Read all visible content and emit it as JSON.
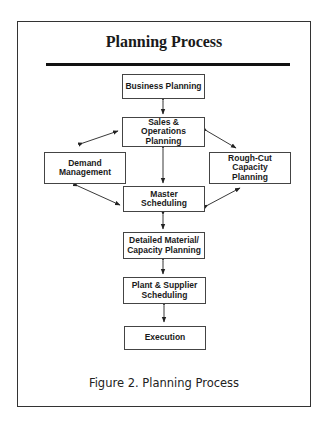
{
  "figure": {
    "title": "Planning Process",
    "caption": "Figure 2. Planning Process"
  },
  "nodes": {
    "business_planning": "Business Planning",
    "sales_operations_planning": "Sales & Operations Planning",
    "demand_management": "Demand Management",
    "rough_cut_capacity_planning": "Rough-Cut Capacity Planning",
    "master_scheduling": "Master Scheduling",
    "detailed_material_capacity_planning": "Detailed Material/ Capacity Planning",
    "plant_supplier_scheduling": "Plant & Supplier Scheduling",
    "execution": "Execution"
  },
  "edges": [
    {
      "from": "Business Planning",
      "to": "Sales & Operations Planning",
      "type": "bidirectional"
    },
    {
      "from": "Sales & Operations Planning",
      "to": "Demand Management",
      "type": "bidirectional"
    },
    {
      "from": "Sales & Operations Planning",
      "to": "Rough-Cut Capacity Planning",
      "type": "bidirectional"
    },
    {
      "from": "Sales & Operations Planning",
      "to": "Master Scheduling",
      "type": "bidirectional"
    },
    {
      "from": "Demand Management",
      "to": "Master Scheduling",
      "type": "bidirectional"
    },
    {
      "from": "Rough-Cut Capacity Planning",
      "to": "Master Scheduling",
      "type": "bidirectional"
    },
    {
      "from": "Master Scheduling",
      "to": "Detailed Material/ Capacity Planning",
      "type": "bidirectional"
    },
    {
      "from": "Detailed Material/ Capacity Planning",
      "to": "Plant & Supplier Scheduling",
      "type": "bidirectional"
    },
    {
      "from": "Plant & Supplier Scheduling",
      "to": "Execution",
      "type": "bidirectional"
    }
  ]
}
